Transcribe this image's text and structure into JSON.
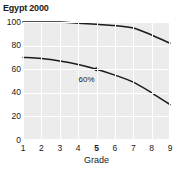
{
  "chart_data": {
    "type": "line",
    "title": "Egypt 2000",
    "xlabel": "Grade",
    "ylabel": "",
    "x": [
      1,
      2,
      3,
      4,
      5,
      6,
      7,
      8,
      9
    ],
    "xticklabels": [
      "1",
      "2",
      "3",
      "4",
      "5",
      "6",
      "7",
      "8",
      "9"
    ],
    "highlighted_xtick": "5",
    "yticklabels": [
      "100",
      "80",
      "60",
      "40",
      "20",
      "0"
    ],
    "ytickvalues": [
      100,
      80,
      60,
      40,
      20,
      0
    ],
    "ylim": [
      0,
      100
    ],
    "xlim": [
      1,
      9
    ],
    "grid": true,
    "legend": "none",
    "series": [
      {
        "name": "upper-curve",
        "values": [
          100,
          100,
          100,
          99,
          98,
          97,
          95,
          89,
          82
        ],
        "color": "#1a1a1a"
      },
      {
        "name": "lower-curve",
        "values": [
          70,
          69,
          67,
          64,
          60,
          55,
          49,
          40,
          30
        ],
        "color": "#1a1a1a"
      }
    ],
    "annotations": [
      {
        "text": "60%",
        "x": 5,
        "y": 60,
        "marker": true,
        "label_offset_x": -18,
        "label_offset_y": 6
      }
    ],
    "top_clipped_text": "",
    "plot_background": "#ececec",
    "grid_color": "#ffffff",
    "line_color": "#1a1a1a",
    "text_color": "#1a1a1a"
  }
}
